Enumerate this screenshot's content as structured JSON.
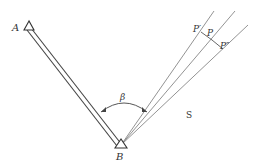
{
  "diagram": {
    "type": "survey-angle-geometry",
    "points": {
      "A": {
        "label": "A",
        "x": 29,
        "y": 27
      },
      "B": {
        "label": "B",
        "x": 120,
        "y": 146
      },
      "P_prime": {
        "label": "P′",
        "x": 203,
        "y": 33
      },
      "P": {
        "label": "P",
        "x": 214,
        "y": 40
      },
      "P_double_prime": {
        "label": "P″",
        "x": 226,
        "y": 53
      }
    },
    "labels": {
      "A": "A",
      "B": "B",
      "P_prime": "P′",
      "P": "P",
      "P_double_prime": "P″",
      "S": "S",
      "beta": "β"
    },
    "angle": {
      "name": "β",
      "between": [
        "BA",
        "BP"
      ]
    },
    "rays_from_B": [
      "P′",
      "P",
      "P″"
    ],
    "line_color": "#555555"
  }
}
